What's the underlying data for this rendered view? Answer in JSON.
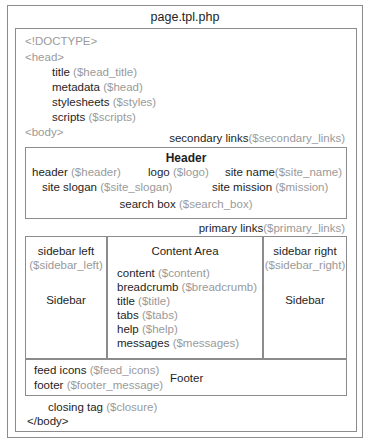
{
  "title": "page.tpl.php",
  "head_section": {
    "doctype": "<!DOCTYPE>",
    "head_tag": "<head>",
    "items": [
      {
        "label": "title",
        "var": "($head_title)"
      },
      {
        "label": "metadata",
        "var": "($head)"
      },
      {
        "label": "stylesheets",
        "var": "($styles)"
      },
      {
        "label": "scripts",
        "var": "($scripts)"
      }
    ],
    "body_tag": "<body>"
  },
  "secondary_links": {
    "label": "secondary links",
    "var": "($secondary_links)"
  },
  "header_box": {
    "title": "Header",
    "row1": [
      {
        "label": "header",
        "var": "($header)"
      },
      {
        "label": "logo",
        "var": "($logo)"
      },
      {
        "label": "site name",
        "var": "($site_name)"
      }
    ],
    "row2": [
      {
        "label": "site slogan",
        "var": "($site_slogan)"
      },
      {
        "label": "site mission",
        "var": "($mission)"
      }
    ],
    "row3": [
      {
        "label": "search box",
        "var": "($search_box)"
      }
    ]
  },
  "primary_links": {
    "label": "primary links",
    "var": "($primary_links)"
  },
  "sidebar_left": {
    "label": "sidebar left",
    "var": "($sidebar_left)",
    "caption": "Sidebar"
  },
  "content_area": {
    "title": "Content Area",
    "items": [
      {
        "label": "content",
        "var": "($content)"
      },
      {
        "label": "breadcrumb",
        "var": "($breadcrumb)"
      },
      {
        "label": "title",
        "var": "($title)"
      },
      {
        "label": "tabs",
        "var": "($tabs)"
      },
      {
        "label": "help",
        "var": "($help)"
      },
      {
        "label": "messages",
        "var": "($messages)"
      }
    ]
  },
  "sidebar_right": {
    "label": "sidebar right",
    "var": "($sidebar_right)",
    "caption": "Sidebar"
  },
  "footer_box": {
    "items": [
      {
        "label": "feed icons",
        "var": "($feed_icons)"
      },
      {
        "label": "footer",
        "var": "($footer_message)"
      }
    ],
    "caption": "Footer"
  },
  "closing": {
    "label": "closing tag",
    "var": "($closure)",
    "body_close": "</body>"
  }
}
